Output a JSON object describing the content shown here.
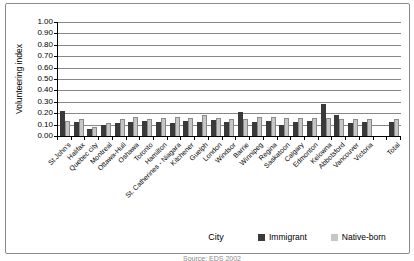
{
  "chart": {
    "y_axis_title": "Volunteering index",
    "x_axis_title": "City",
    "footer_partial": "Source: EDS 2002"
  },
  "chart_data": {
    "type": "bar",
    "title": "",
    "xlabel": "City",
    "ylabel": "Volunteering index",
    "ylim": [
      0,
      1.0
    ],
    "ytick_step": 0.1,
    "ytick_format": "0.00",
    "grid": true,
    "legend_position": "bottom-right",
    "gap_before_last_category": true,
    "categories": [
      "St.John's",
      "Halifax",
      "Quebec city",
      "Montreal",
      "Ottawa-Hull",
      "Oshawa",
      "Toronto",
      "Hamilton",
      "St. Catherines - Niagara",
      "Kitchener",
      "Guelph",
      "London",
      "Windsor",
      "Barrie",
      "Winnipeg",
      "Regina",
      "Saskatoon",
      "Calgary",
      "Edmonton",
      "Kelowna",
      "Abbotsford",
      "Vancouver",
      "Victoria",
      "Total"
    ],
    "series": [
      {
        "name": "Immigrant",
        "color": "#3a3a3a",
        "values": [
          0.22,
          0.12,
          0.06,
          0.1,
          0.11,
          0.12,
          0.13,
          0.12,
          0.11,
          0.13,
          0.12,
          0.14,
          0.12,
          0.21,
          0.12,
          0.13,
          0.1,
          0.12,
          0.13,
          0.28,
          0.18,
          0.11,
          0.12,
          0.12
        ]
      },
      {
        "name": "Native-born",
        "color": "#c6c6c6",
        "values": [
          0.13,
          0.15,
          0.08,
          0.11,
          0.15,
          0.17,
          0.15,
          0.16,
          0.17,
          0.16,
          0.18,
          0.16,
          0.15,
          0.15,
          0.17,
          0.17,
          0.16,
          0.16,
          0.16,
          0.16,
          0.15,
          0.15,
          0.15,
          0.15
        ]
      }
    ]
  }
}
